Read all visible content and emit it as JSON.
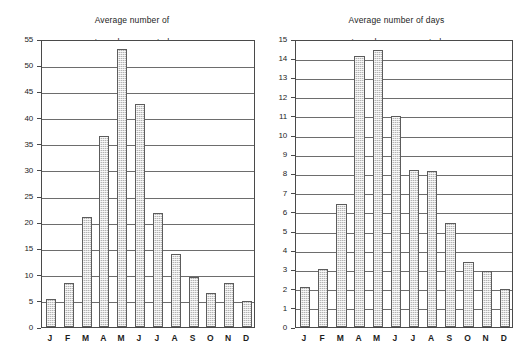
{
  "chart_data": [
    {
      "type": "bar",
      "title": "Average number of tornadoes reported",
      "title_lines": [
        "Average number of",
        "tornadoes  reported"
      ],
      "xlabel": "",
      "ylabel": "",
      "ylim": [
        0,
        55
      ],
      "ytick_step": 5,
      "yticks": [
        0,
        5,
        10,
        15,
        20,
        25,
        30,
        35,
        40,
        45,
        50,
        55
      ],
      "ytick_labels": [
        "0",
        "5",
        "10",
        "15",
        "20",
        "25",
        "30",
        "35",
        "40",
        "45",
        "50",
        "55"
      ],
      "grid": true,
      "legend": "none",
      "categories": [
        "J",
        "F",
        "M",
        "A",
        "M",
        "J",
        "J",
        "A",
        "S",
        "O",
        "N",
        "D"
      ],
      "values": [
        5.3,
        8.4,
        21.0,
        36.4,
        53.0,
        42.5,
        21.7,
        14.0,
        9.6,
        6.5,
        8.5,
        4.9
      ],
      "bar_fill": "#b4b4b4",
      "bar_edge": "#5c5c5c"
    },
    {
      "type": "bar",
      "title": "Average number of days tornadoes are reported",
      "title_lines": [
        "Average number of days",
        "tornadoes are reported"
      ],
      "xlabel": "",
      "ylabel": "",
      "ylim": [
        0,
        15
      ],
      "ytick_step": 1,
      "yticks": [
        0,
        1,
        2,
        3,
        4,
        5,
        6,
        7,
        8,
        9,
        10,
        11,
        12,
        13,
        14,
        15
      ],
      "ytick_labels": [
        "0",
        "1",
        "2",
        "3",
        "4",
        "5",
        "6",
        "7",
        "8",
        "9",
        "10",
        "11",
        "12",
        "13",
        "14",
        "15"
      ],
      "grid": true,
      "legend": "none",
      "categories": [
        "J",
        "F",
        "M",
        "A",
        "M",
        "J",
        "J",
        "A",
        "S",
        "O",
        "N",
        "D"
      ],
      "values": [
        2.1,
        3.0,
        6.4,
        14.1,
        14.45,
        11.0,
        8.2,
        8.1,
        5.4,
        3.4,
        2.9,
        2.0
      ],
      "bar_fill": "#b4b4b4",
      "bar_edge": "#5c5c5c"
    }
  ],
  "figure": {
    "background": "#ffffff",
    "panel_count": 2
  }
}
